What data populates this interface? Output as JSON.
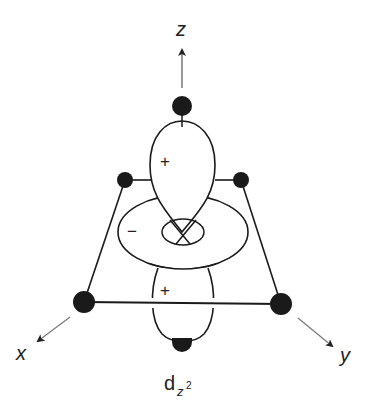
{
  "diagram": {
    "title_label": "d",
    "title_subscript": "z",
    "title_superscript": "2",
    "axes": {
      "z": "z",
      "x": "x",
      "y": "y"
    },
    "signs": {
      "upper_lobe": "+",
      "torus": "−",
      "lower_lobe": "+"
    },
    "colors": {
      "line": "#1a1a1a",
      "ligand": "#1a1a1a",
      "axis": "#555555",
      "background": "#ffffff"
    }
  }
}
